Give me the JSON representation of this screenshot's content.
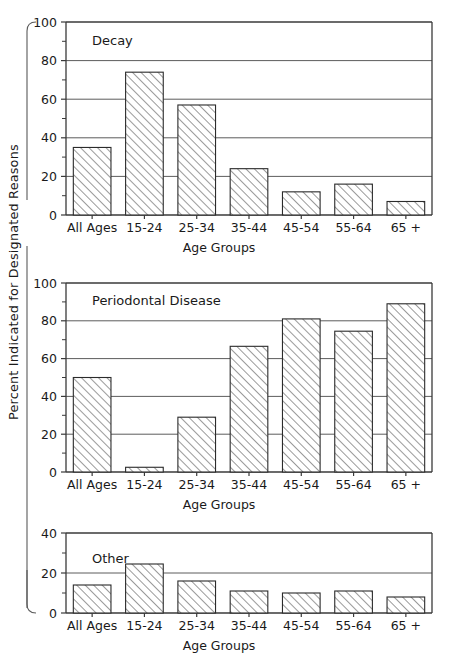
{
  "figure": {
    "ylabel": "Percent Indicated for Designated Reasons",
    "xlabel": "Age Groups"
  },
  "chart_data": [
    {
      "type": "bar",
      "title": "Decay",
      "categories": [
        "All Ages",
        "15-24",
        "25-34",
        "35-44",
        "45-54",
        "55-64",
        "65 +"
      ],
      "values": [
        35,
        74,
        57,
        24,
        12,
        16,
        7
      ],
      "xlabel": "Age Groups",
      "ylabel": "Percent Indicated for Designated Reasons",
      "ylim": [
        0,
        100
      ],
      "yticks": [
        0,
        20,
        40,
        60,
        80,
        100
      ],
      "ytick_labels": [
        "0",
        "20",
        "40",
        "60",
        "80",
        "100"
      ],
      "minor_yticks": [
        10,
        30,
        50,
        70,
        90
      ],
      "grid": true,
      "legend": "none"
    },
    {
      "type": "bar",
      "title": "Periodontal Disease",
      "categories": [
        "All Ages",
        "15-24",
        "25-34",
        "35-44",
        "45-54",
        "55-64",
        "65 +"
      ],
      "values": [
        50,
        2.5,
        29,
        66.5,
        81,
        74.5,
        89
      ],
      "xlabel": "Age Groups",
      "ylabel": "Percent Indicated for Designated Reasons",
      "ylim": [
        0,
        100
      ],
      "yticks": [
        0,
        20,
        40,
        60,
        80,
        100
      ],
      "ytick_labels": [
        "0",
        "20",
        "40",
        "60",
        "80",
        "100"
      ],
      "minor_yticks": [
        10,
        30,
        50,
        70,
        90
      ],
      "grid": true,
      "legend": "none"
    },
    {
      "type": "bar",
      "title": "Other",
      "categories": [
        "All Ages",
        "15-24",
        "25-34",
        "35-44",
        "45-54",
        "55-64",
        "65 +"
      ],
      "values": [
        14,
        24.5,
        16,
        11,
        10,
        11,
        8
      ],
      "xlabel": "Age Groups",
      "ylabel": "Percent Indicated for Designated Reasons",
      "ylim": [
        0,
        40
      ],
      "yticks": [
        0,
        20,
        40
      ],
      "ytick_labels": [
        "0",
        "20",
        "40"
      ],
      "minor_yticks": [
        10,
        30
      ],
      "grid": true,
      "legend": "none"
    }
  ],
  "colors": {
    "bar_edge": "#2b2b2b",
    "bar_face": "#ffffff",
    "hatch": "#555555",
    "axis": "#3a3a3a",
    "grid": "#4a4a4a",
    "text": "#1a1a1a",
    "background": "#ffffff"
  }
}
